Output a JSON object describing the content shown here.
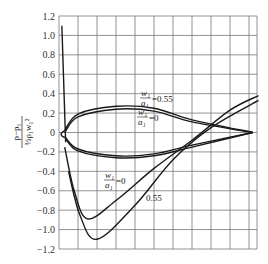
{
  "chart_data": {
    "type": "line",
    "title": "",
    "xlabel": "",
    "ylabel": "(p - p1) / (1/2 ρ1 w1²)",
    "ylabel_parts": {
      "numerator": "p−p₁",
      "denominator": "½ρ₁w₁²"
    },
    "ylim": [
      -1.2,
      1.2
    ],
    "yticks": [
      "1.2",
      "1.0",
      "0.8",
      "0.6",
      "0.4",
      "0.2",
      "0",
      "-0.2",
      "-0.4",
      "-0.6",
      "-0.8",
      "-1.0",
      "-1.2"
    ],
    "grid": true,
    "annotations": [
      {
        "text": "w1/a1=0.55",
        "near": "upper loop"
      },
      {
        "text": "w1/a1=0",
        "near": "upper loop inner"
      },
      {
        "text": "w1/a1=0",
        "near": "lower curve"
      },
      {
        "text": "0.55",
        "near": "lower curve"
      }
    ],
    "series": [
      {
        "name": "loop upper w1/a1=0.55",
        "x": [
          0.3,
          1,
          3,
          5,
          7,
          10.2
        ],
        "values": [
          0.02,
          0.19,
          0.27,
          0.25,
          0.13,
          0.0
        ]
      },
      {
        "name": "loop upper w1/a1=0",
        "x": [
          0.3,
          1,
          3,
          5,
          7,
          10.2
        ],
        "values": [
          0.0,
          0.16,
          0.24,
          0.22,
          0.11,
          0.0
        ]
      },
      {
        "name": "loop lower w1/a1=0.55",
        "x": [
          0.3,
          1,
          3,
          5,
          7,
          10.2
        ],
        "values": [
          -0.05,
          -0.19,
          -0.26,
          -0.24,
          -0.15,
          0.0
        ]
      },
      {
        "name": "loop lower w1/a1=0",
        "x": [
          0.3,
          1,
          3,
          5,
          7,
          10.2
        ],
        "values": [
          -0.04,
          -0.17,
          -0.24,
          -0.22,
          -0.13,
          0.0
        ]
      },
      {
        "name": "spike",
        "x": [
          0.15,
          0.35
        ],
        "values": [
          1.1,
          -0.1
        ]
      },
      {
        "name": "w1/a1=0",
        "x": [
          0.3,
          0.8,
          1.5,
          3,
          5,
          7,
          9,
          10.5
        ],
        "values": [
          -0.15,
          -0.6,
          -0.89,
          -0.7,
          -0.37,
          -0.08,
          0.23,
          0.38
        ]
      },
      {
        "name": "w1/a1=0.55",
        "x": [
          0.5,
          1.1,
          2,
          4,
          6,
          8,
          10.5
        ],
        "values": [
          -0.4,
          -0.85,
          -1.1,
          -0.75,
          -0.28,
          0.05,
          0.33
        ]
      }
    ]
  }
}
